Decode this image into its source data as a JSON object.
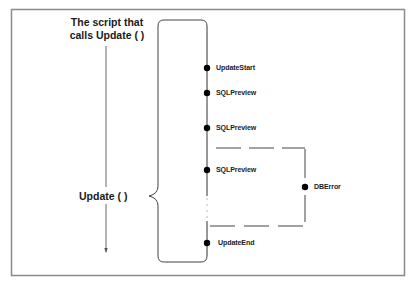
{
  "caller": {
    "title_line1": "The script that",
    "title_line2": "calls Update ( )"
  },
  "function": {
    "label": "Update ( )"
  },
  "events": [
    {
      "label": "UpdateStart",
      "y": 68
    },
    {
      "label": "SQLPreview",
      "y": 93
    },
    {
      "label": "SQLPreview",
      "y": 128
    },
    {
      "label": "SQLPreview",
      "y": 170
    },
    {
      "label": "UpdateEnd",
      "y": 243
    }
  ],
  "error_event": {
    "label": "DBError"
  },
  "colors": {
    "line": "#333333",
    "border": "#888888",
    "dot": "#000000",
    "text": "#1a1a1a"
  }
}
